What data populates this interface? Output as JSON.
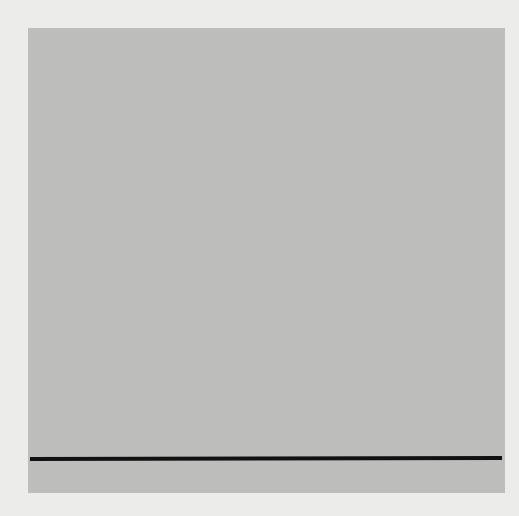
{
  "chart_data": {
    "type": "line",
    "title": "",
    "ylabel": "mm Hg",
    "xlabel": "",
    "y_ticks": [
      "30",
      "20",
      "10"
    ],
    "ylim": [
      -1,
      33
    ],
    "grid": true,
    "series": [
      {
        "name": "ECG",
        "beats": 10,
        "note": "regular rhythm, evenly spaced complexes"
      },
      {
        "name": "Pressure",
        "units": "mm Hg",
        "beats": [
          {
            "peak": 25,
            "trough": 9.5
          },
          {
            "peak": 26,
            "trough": 9.5
          },
          {
            "peak": 24.5,
            "trough": 10
          },
          {
            "peak": 21.5,
            "trough": 9.5
          },
          {
            "peak": 20.5,
            "trough": 9
          },
          {
            "peak": 25,
            "trough": 0.5
          },
          {
            "peak": 25.5,
            "trough": -0.5
          },
          {
            "peak": 25,
            "trough": -1
          },
          {
            "peak": 23.5,
            "trough": -1
          },
          {
            "peak": 25,
            "trough": 0
          }
        ]
      }
    ],
    "calibration_lines": [
      30,
      20,
      10
    ],
    "baseline": 0
  },
  "labels": {
    "unit": "mm Hg",
    "t30": "30",
    "t20": "20",
    "t10": "10"
  },
  "colors": {
    "paper": "#bdbdbb",
    "background": "#ececea",
    "trace": "#1a1a1a",
    "grid_major": "#555555",
    "grid_minor": "#a0a09e"
  }
}
